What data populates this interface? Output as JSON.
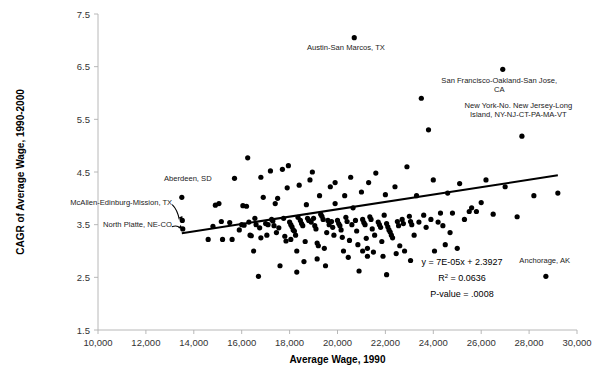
{
  "chart_data": {
    "type": "scatter",
    "title": "",
    "xlabel": "Average Wage, 1990",
    "ylabel": "CAGR of Average Wage, 1990-2000",
    "xlim": [
      10000,
      30000
    ],
    "ylim": [
      1.5,
      7.5
    ],
    "xticks": [
      10000,
      12000,
      14000,
      16000,
      18000,
      20000,
      22000,
      24000,
      26000,
      28000,
      30000
    ],
    "xtick_labels": [
      "10,000",
      "12,000",
      "14,000",
      "16,000",
      "18,000",
      "20,000",
      "22,000",
      "24,000",
      "26,000",
      "28,000",
      "30,000"
    ],
    "yticks": [
      1.5,
      2.5,
      3.5,
      4.5,
      5.5,
      6.5,
      7.5
    ],
    "ytick_labels": [
      "1.5",
      "2.5",
      "3.5",
      "4.5",
      "5.5",
      "6.5",
      "7.5"
    ],
    "grid": false,
    "legend": "none",
    "marker_color": "#000000",
    "marker_size": 2.6,
    "trendline": {
      "equation_label": "y = 7E-05x + 2.3927",
      "r_squared_label": "R",
      "r_squared_sup": "2",
      "r_squared_value": " = 0.0636",
      "p_value_label": "P-value = .0008",
      "slope": 7e-05,
      "intercept": 2.3927,
      "x_start": 13500,
      "x_end": 29200,
      "color": "#000000"
    },
    "annotations": [
      {
        "id": "austin",
        "text": "Austin-San Marcos, TX",
        "x": 20700,
        "y": 7.05,
        "label_x": 20350,
        "label_y": 6.82,
        "anchor": "middle",
        "leader": false
      },
      {
        "id": "san-francisco",
        "text_line1": "San Francisco-Oakland-San Jose,",
        "text_line2": "CA",
        "x": 26900,
        "y": 6.45,
        "label_x": 26750,
        "label_y": 6.2,
        "anchor": "middle",
        "leader": false
      },
      {
        "id": "new-york",
        "text_line1": "New York-No. New Jersey-Long",
        "text_line2": "Island, NY-NJ-CT-PA-MA-VT",
        "x": 27700,
        "y": 5.18,
        "label_x": 27550,
        "label_y": 5.72,
        "anchor": "middle",
        "leader": false
      },
      {
        "id": "aberdeen",
        "text": "Aberdeen, SD",
        "x": 13500,
        "y": 4.02,
        "label_x": 13750,
        "label_y": 4.33,
        "anchor": "middle",
        "leader": false
      },
      {
        "id": "mcallen",
        "text": "McAllen-Edinburg-Mission, TX",
        "x": 13520,
        "y": 3.58,
        "label_x": 13100,
        "label_y": 3.88,
        "anchor": "end",
        "leader": true
      },
      {
        "id": "north-platte",
        "text": "North Platte, NE-CO",
        "x": 13540,
        "y": 3.42,
        "label_x": 13080,
        "label_y": 3.46,
        "anchor": "end",
        "leader": true
      },
      {
        "id": "anchorage",
        "text": "Anchorage, AK",
        "x": 28700,
        "y": 2.52,
        "label_x": 28650,
        "label_y": 2.78,
        "anchor": "middle",
        "leader": false
      }
    ],
    "points": [
      [
        13500,
        4.02
      ],
      [
        13520,
        3.58
      ],
      [
        13540,
        3.42
      ],
      [
        14600,
        3.22
      ],
      [
        14800,
        3.47
      ],
      [
        14900,
        3.87
      ],
      [
        15050,
        3.9
      ],
      [
        15150,
        3.56
      ],
      [
        15200,
        3.22
      ],
      [
        15500,
        3.54
      ],
      [
        15600,
        3.22
      ],
      [
        15700,
        4.38
      ],
      [
        16000,
        3.5
      ],
      [
        16050,
        3.86
      ],
      [
        16100,
        3.49
      ],
      [
        16200,
        3.85
      ],
      [
        16250,
        4.77
      ],
      [
        16300,
        3.55
      ],
      [
        16350,
        3.3
      ],
      [
        16400,
        3.29
      ],
      [
        16500,
        3.0
      ],
      [
        16550,
        3.62
      ],
      [
        16600,
        3.5
      ],
      [
        16700,
        2.52
      ],
      [
        16750,
        3.44
      ],
      [
        16800,
        3.25
      ],
      [
        16900,
        4.02
      ],
      [
        17000,
        3.52
      ],
      [
        17050,
        3.3
      ],
      [
        17100,
        3.5
      ],
      [
        17200,
        4.52
      ],
      [
        17250,
        3.6
      ],
      [
        17300,
        3.57
      ],
      [
        17350,
        3.48
      ],
      [
        17400,
        3.9
      ],
      [
        17500,
        4.0
      ],
      [
        17550,
        3.44
      ],
      [
        17600,
        2.72
      ],
      [
        17700,
        4.55
      ],
      [
        17750,
        3.62
      ],
      [
        17800,
        3.28
      ],
      [
        17850,
        3.19
      ],
      [
        17900,
        4.2
      ],
      [
        18000,
        3.55
      ],
      [
        18050,
        3.5
      ],
      [
        18100,
        3.46
      ],
      [
        18150,
        3.4
      ],
      [
        18200,
        3.38
      ],
      [
        18250,
        3.3
      ],
      [
        18300,
        3.0
      ],
      [
        18350,
        3.64
      ],
      [
        18400,
        4.25
      ],
      [
        18450,
        3.58
      ],
      [
        18500,
        3.52
      ],
      [
        18550,
        3.48
      ],
      [
        18600,
        2.8
      ],
      [
        18650,
        3.18
      ],
      [
        18700,
        3.88
      ],
      [
        18750,
        3.62
      ],
      [
        18800,
        3.58
      ],
      [
        18900,
        3.55
      ],
      [
        18950,
        4.5
      ],
      [
        19000,
        3.62
      ],
      [
        19050,
        3.48
      ],
      [
        19100,
        3.42
      ],
      [
        19150,
        3.15
      ],
      [
        19200,
        3.1
      ],
      [
        19250,
        4.05
      ],
      [
        19300,
        3.7
      ],
      [
        19350,
        3.66
      ],
      [
        19400,
        3.6
      ],
      [
        19450,
        3.05
      ],
      [
        19500,
        2.72
      ],
      [
        19600,
        3.58
      ],
      [
        19650,
        3.5
      ],
      [
        19700,
        4.22
      ],
      [
        19750,
        3.56
      ],
      [
        19800,
        3.45
      ],
      [
        19850,
        3.3
      ],
      [
        19900,
        4.3
      ],
      [
        20000,
        3.58
      ],
      [
        20050,
        3.52
      ],
      [
        20100,
        3.48
      ],
      [
        20150,
        3.4
      ],
      [
        20200,
        3.26
      ],
      [
        20300,
        4.05
      ],
      [
        20350,
        3.64
      ],
      [
        20400,
        3.56
      ],
      [
        20450,
        2.88
      ],
      [
        20500,
        3.2
      ],
      [
        20550,
        4.4
      ],
      [
        20600,
        3.5
      ],
      [
        20700,
        7.05
      ],
      [
        20750,
        3.58
      ],
      [
        20800,
        3.38
      ],
      [
        20850,
        3.12
      ],
      [
        20900,
        2.62
      ],
      [
        21000,
        4.12
      ],
      [
        21050,
        3.6
      ],
      [
        21100,
        3.54
      ],
      [
        21150,
        3.5
      ],
      [
        21200,
        3.24
      ],
      [
        21250,
        3.05
      ],
      [
        21300,
        4.3
      ],
      [
        21350,
        3.65
      ],
      [
        21400,
        3.6
      ],
      [
        21450,
        3.42
      ],
      [
        21500,
        2.98
      ],
      [
        21550,
        3.3
      ],
      [
        21600,
        4.48
      ],
      [
        21700,
        3.55
      ],
      [
        21750,
        3.5
      ],
      [
        21800,
        3.45
      ],
      [
        21850,
        3.18
      ],
      [
        21900,
        2.9
      ],
      [
        22000,
        4.07
      ],
      [
        22050,
        3.52
      ],
      [
        22100,
        3.46
      ],
      [
        22150,
        3.4
      ],
      [
        22200,
        3.36
      ],
      [
        22250,
        3.3
      ],
      [
        22300,
        3.25
      ],
      [
        22400,
        4.22
      ],
      [
        22500,
        3.56
      ],
      [
        22550,
        3.48
      ],
      [
        22600,
        3.1
      ],
      [
        22700,
        3.6
      ],
      [
        22750,
        3.52
      ],
      [
        22800,
        3.0
      ],
      [
        22900,
        4.6
      ],
      [
        23000,
        3.66
      ],
      [
        23050,
        3.56
      ],
      [
        23100,
        3.5
      ],
      [
        23200,
        3.3
      ],
      [
        23300,
        4.05
      ],
      [
        23400,
        3.55
      ],
      [
        23500,
        5.9
      ],
      [
        23600,
        3.68
      ],
      [
        23700,
        3.45
      ],
      [
        23800,
        5.3
      ],
      [
        23900,
        3.6
      ],
      [
        24000,
        4.35
      ],
      [
        24200,
        3.55
      ],
      [
        24300,
        3.72
      ],
      [
        24400,
        3.48
      ],
      [
        24500,
        3.12
      ],
      [
        24600,
        4.1
      ],
      [
        24800,
        3.72
      ],
      [
        25000,
        3.05
      ],
      [
        25100,
        4.28
      ],
      [
        25300,
        3.6
      ],
      [
        25500,
        3.75
      ],
      [
        25600,
        3.82
      ],
      [
        25800,
        3.75
      ],
      [
        26000,
        3.92
      ],
      [
        26200,
        4.35
      ],
      [
        26500,
        3.7
      ],
      [
        26900,
        6.45
      ],
      [
        27000,
        4.22
      ],
      [
        27500,
        3.65
      ],
      [
        27700,
        5.18
      ],
      [
        28200,
        4.05
      ],
      [
        28700,
        2.52
      ],
      [
        29200,
        4.1
      ],
      [
        15900,
        3.4
      ],
      [
        17450,
        3.35
      ],
      [
        18050,
        3.22
      ],
      [
        19550,
        3.35
      ],
      [
        20250,
        3.0
      ],
      [
        21050,
        3.0
      ],
      [
        21250,
        2.9
      ],
      [
        22450,
        2.95
      ],
      [
        23050,
        2.82
      ],
      [
        24050,
        3.0
      ],
      [
        19150,
        2.85
      ],
      [
        18300,
        2.6
      ],
      [
        22050,
        2.55
      ],
      [
        21950,
        3.68
      ],
      [
        20650,
        3.82
      ],
      [
        19900,
        3.9
      ],
      [
        18850,
        4.35
      ],
      [
        17950,
        4.62
      ],
      [
        16800,
        4.4
      ],
      [
        24700,
        3.35
      ]
    ]
  }
}
